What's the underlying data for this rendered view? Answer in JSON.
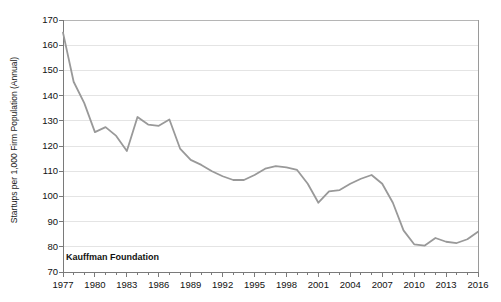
{
  "chart_data": {
    "type": "line",
    "title": "",
    "xlabel": "",
    "ylabel": "Startups per 1,000 Firm Population (Annual)",
    "annotation": "Kauffman Foundation",
    "grid": true,
    "legend": "none",
    "line_color": "#999999",
    "axis_color": "#7a7a7a",
    "grid_color": "#e4e4e4",
    "text_color": "#111111",
    "xlim": [
      1977,
      2016
    ],
    "ylim": [
      70,
      170
    ],
    "ytick_values": [
      70,
      80,
      90,
      100,
      110,
      120,
      130,
      140,
      150,
      160,
      170
    ],
    "ytick_labels": [
      "70",
      "80",
      "90",
      "100",
      "110",
      "120",
      "130",
      "140",
      "150",
      "160",
      "170"
    ],
    "xtick_values": [
      1977,
      1980,
      1983,
      1986,
      1989,
      1992,
      1995,
      1998,
      2001,
      2004,
      2007,
      2010,
      2013,
      2016
    ],
    "xtick_labels": [
      "1977",
      "1980",
      "1983",
      "1986",
      "1989",
      "1992",
      "1995",
      "1998",
      "2001",
      "2004",
      "2007",
      "2010",
      "2013",
      "2016"
    ],
    "x": [
      1977,
      1978,
      1979,
      1980,
      1981,
      1982,
      1983,
      1984,
      1985,
      1986,
      1987,
      1988,
      1989,
      1990,
      1991,
      1992,
      1993,
      1994,
      1995,
      1996,
      1997,
      1998,
      1999,
      2000,
      2001,
      2002,
      2003,
      2004,
      2005,
      2006,
      2007,
      2008,
      2009,
      2010,
      2011,
      2012,
      2013,
      2014,
      2015,
      2016
    ],
    "values": [
      165.0,
      145.5,
      137.0,
      125.5,
      127.5,
      124.0,
      118.0,
      131.5,
      128.5,
      128.0,
      130.5,
      119.0,
      114.5,
      112.5,
      110.0,
      108.0,
      106.5,
      106.5,
      108.5,
      111.0,
      112.0,
      111.5,
      110.5,
      105.0,
      97.5,
      102.0,
      102.5,
      105.0,
      107.0,
      108.5,
      105.0,
      97.5,
      86.5,
      81.0,
      80.5,
      83.5,
      82.0,
      81.5,
      83.0,
      86.0
    ],
    "series": [
      {
        "name": "Startup Rate",
        "values": [
          165.0,
          145.5,
          137.0,
          125.5,
          127.5,
          124.0,
          118.0,
          131.5,
          128.5,
          128.0,
          130.5,
          119.0,
          114.5,
          112.5,
          110.0,
          108.0,
          106.5,
          106.5,
          108.5,
          111.0,
          112.0,
          111.5,
          110.5,
          105.0,
          97.5,
          102.0,
          102.5,
          105.0,
          107.0,
          108.5,
          105.0,
          97.5,
          86.5,
          81.0,
          80.5,
          83.5,
          82.0,
          81.5,
          83.0,
          86.0
        ]
      }
    ]
  },
  "geometry": {
    "plot_left": 63,
    "plot_right": 478,
    "plot_top": 20,
    "plot_bottom": 272
  }
}
